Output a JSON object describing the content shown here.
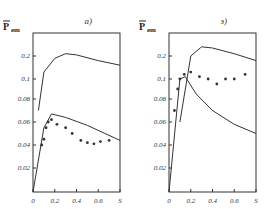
{
  "chart_data": [
    {
      "type": "scatter",
      "title": "a)",
      "xlabel": "S",
      "ylabel": "P̄em",
      "x_ticks": [
        "0",
        "0.2",
        "0.4",
        "0.6",
        "S"
      ],
      "y_ticks": [
        "0.02",
        "0.04",
        "0.06",
        "0.08",
        "0.1",
        "0.2"
      ],
      "xlim": [
        0,
        0.8
      ],
      "y_scale_note": "nonlinear, 0.1 to 0.2 spacing compressed relative to 0.02 steps (interpreted from tick positions)",
      "grid": false,
      "values_are_approximate": true,
      "series": [
        {
          "name": "upper curve",
          "kind": "line",
          "points": [
            [
              0.05,
              0.07
            ],
            [
              0.1,
              0.13
            ],
            [
              0.2,
              0.19
            ],
            [
              0.3,
              0.21
            ],
            [
              0.4,
              0.205
            ],
            [
              0.6,
              0.18
            ],
            [
              0.8,
              0.16
            ]
          ]
        },
        {
          "name": "lower curve",
          "kind": "line",
          "points": [
            [
              0,
              0
            ],
            [
              0.1,
              0.055
            ],
            [
              0.17,
              0.067
            ],
            [
              0.3,
              0.064
            ],
            [
              0.5,
              0.057
            ],
            [
              0.8,
              0.044
            ]
          ]
        },
        {
          "name": "points",
          "kind": "markers",
          "points": [
            [
              0.08,
              0.04
            ],
            [
              0.1,
              0.045
            ],
            [
              0.12,
              0.055
            ],
            [
              0.14,
              0.06
            ],
            [
              0.17,
              0.062
            ],
            [
              0.22,
              0.058
            ],
            [
              0.3,
              0.055
            ],
            [
              0.36,
              0.05
            ],
            [
              0.44,
              0.044
            ],
            [
              0.5,
              0.042
            ],
            [
              0.56,
              0.041
            ],
            [
              0.62,
              0.043
            ],
            [
              0.7,
              0.044
            ]
          ]
        }
      ]
    },
    {
      "type": "scatter",
      "title": "з)",
      "xlabel": "S",
      "ylabel": "P̄em",
      "x_ticks": [
        "0",
        "0.2",
        "0.4",
        "0.6",
        "S"
      ],
      "y_ticks": [
        "0.02",
        "0.04",
        "0.06",
        "0.08",
        "0.1",
        "0.2"
      ],
      "xlim": [
        0,
        0.8
      ],
      "y_scale_note": "nonlinear, 0.1 to 0.2 spacing compressed relative to 0.02 steps (interpreted from tick positions)",
      "grid": false,
      "values_are_approximate": true,
      "series": [
        {
          "name": "upper curve",
          "kind": "line",
          "points": [
            [
              0.1,
              0.06
            ],
            [
              0.2,
              0.2
            ],
            [
              0.3,
              0.24
            ],
            [
              0.4,
              0.235
            ],
            [
              0.6,
              0.21
            ],
            [
              0.8,
              0.18
            ]
          ]
        },
        {
          "name": "lower curve",
          "kind": "line",
          "points": [
            [
              0,
              0
            ],
            [
              0.1,
              0.1
            ],
            [
              0.15,
              0.11
            ],
            [
              0.25,
              0.085
            ],
            [
              0.4,
              0.07
            ],
            [
              0.6,
              0.058
            ],
            [
              0.8,
              0.05
            ]
          ]
        },
        {
          "name": "points",
          "kind": "markers",
          "points": [
            [
              0.05,
              0.07
            ],
            [
              0.08,
              0.09
            ],
            [
              0.1,
              0.1
            ],
            [
              0.14,
              0.12
            ],
            [
              0.2,
              0.13
            ],
            [
              0.28,
              0.11
            ],
            [
              0.36,
              0.1
            ],
            [
              0.44,
              0.095
            ],
            [
              0.52,
              0.1
            ],
            [
              0.6,
              0.1
            ],
            [
              0.7,
              0.12
            ]
          ]
        }
      ]
    }
  ]
}
